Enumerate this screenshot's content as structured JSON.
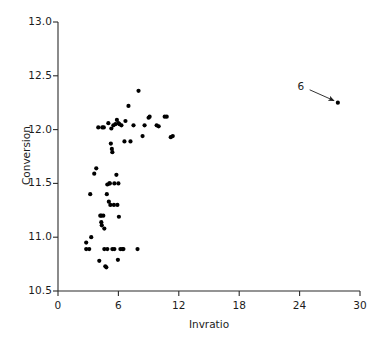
{
  "chart_data": {
    "type": "scatter",
    "title": "",
    "xlabel": "Invratio",
    "ylabel": "Conversion",
    "xlim": [
      0,
      30
    ],
    "ylim": [
      10.5,
      13.0
    ],
    "xticks": [
      0,
      6,
      12,
      18,
      24,
      30
    ],
    "yticks": [
      10.5,
      11.0,
      11.5,
      12.0,
      12.5,
      13.0
    ],
    "xticklabels": [
      "0",
      "6",
      "12",
      "18",
      "24",
      "30"
    ],
    "yticklabels": [
      "10.5",
      "11.0",
      "11.5",
      "12.0",
      "12.5",
      "13.0"
    ],
    "grid": false,
    "legend": false,
    "marker": "filled-circle",
    "marker_color": "#000000",
    "marker_size": 4.0,
    "points": [
      {
        "x": 2.8,
        "y": 10.95
      },
      {
        "x": 2.8,
        "y": 10.89
      },
      {
        "x": 3.1,
        "y": 10.89
      },
      {
        "x": 3.2,
        "y": 11.4
      },
      {
        "x": 3.3,
        "y": 11.0
      },
      {
        "x": 3.6,
        "y": 11.59
      },
      {
        "x": 3.8,
        "y": 11.64
      },
      {
        "x": 4.0,
        "y": 12.02
      },
      {
        "x": 4.1,
        "y": 10.78
      },
      {
        "x": 4.2,
        "y": 11.2
      },
      {
        "x": 4.3,
        "y": 11.2
      },
      {
        "x": 4.3,
        "y": 11.14
      },
      {
        "x": 4.35,
        "y": 11.11
      },
      {
        "x": 4.4,
        "y": 12.02
      },
      {
        "x": 4.5,
        "y": 11.2
      },
      {
        "x": 4.55,
        "y": 12.02
      },
      {
        "x": 4.6,
        "y": 11.08
      },
      {
        "x": 4.6,
        "y": 10.89
      },
      {
        "x": 4.7,
        "y": 10.73
      },
      {
        "x": 4.8,
        "y": 10.72
      },
      {
        "x": 4.85,
        "y": 11.4
      },
      {
        "x": 4.9,
        "y": 11.49
      },
      {
        "x": 4.9,
        "y": 10.89
      },
      {
        "x": 5.0,
        "y": 12.06
      },
      {
        "x": 5.05,
        "y": 11.33
      },
      {
        "x": 5.1,
        "y": 11.5
      },
      {
        "x": 5.15,
        "y": 11.5
      },
      {
        "x": 5.2,
        "y": 11.3
      },
      {
        "x": 5.25,
        "y": 11.87
      },
      {
        "x": 5.3,
        "y": 12.01
      },
      {
        "x": 5.35,
        "y": 11.82
      },
      {
        "x": 5.4,
        "y": 11.79
      },
      {
        "x": 5.4,
        "y": 10.89
      },
      {
        "x": 5.5,
        "y": 12.04
      },
      {
        "x": 5.55,
        "y": 11.3
      },
      {
        "x": 5.6,
        "y": 11.5
      },
      {
        "x": 5.6,
        "y": 10.89
      },
      {
        "x": 5.7,
        "y": 12.05
      },
      {
        "x": 5.8,
        "y": 11.58
      },
      {
        "x": 5.85,
        "y": 12.09
      },
      {
        "x": 5.9,
        "y": 11.3
      },
      {
        "x": 5.95,
        "y": 10.79
      },
      {
        "x": 6.0,
        "y": 12.06
      },
      {
        "x": 6.0,
        "y": 11.5
      },
      {
        "x": 6.05,
        "y": 11.19
      },
      {
        "x": 6.1,
        "y": 12.05
      },
      {
        "x": 6.2,
        "y": 10.89
      },
      {
        "x": 6.3,
        "y": 12.04
      },
      {
        "x": 6.4,
        "y": 10.89
      },
      {
        "x": 6.5,
        "y": 10.89
      },
      {
        "x": 6.6,
        "y": 11.89
      },
      {
        "x": 6.7,
        "y": 12.08
      },
      {
        "x": 7.0,
        "y": 12.22
      },
      {
        "x": 7.2,
        "y": 11.89
      },
      {
        "x": 7.5,
        "y": 12.04
      },
      {
        "x": 7.9,
        "y": 10.89
      },
      {
        "x": 8.0,
        "y": 12.36
      },
      {
        "x": 8.4,
        "y": 11.94
      },
      {
        "x": 8.6,
        "y": 12.04
      },
      {
        "x": 9.0,
        "y": 12.11
      },
      {
        "x": 9.1,
        "y": 12.12
      },
      {
        "x": 9.8,
        "y": 12.04
      },
      {
        "x": 10.0,
        "y": 12.03
      },
      {
        "x": 10.6,
        "y": 12.12
      },
      {
        "x": 10.8,
        "y": 12.12
      },
      {
        "x": 11.2,
        "y": 11.93
      },
      {
        "x": 11.4,
        "y": 11.94
      },
      {
        "x": 27.8,
        "y": 12.25
      }
    ],
    "annotations": [
      {
        "text": "6",
        "label_x": 24.2,
        "label_y": 12.4,
        "arrow_from_x": 25.0,
        "arrow_from_y": 12.37,
        "arrow_to_x": 27.4,
        "arrow_to_y": 12.27,
        "note": "callout pointing at outlier observation"
      }
    ]
  },
  "axes": {
    "spine_color": "#2b2b2b",
    "tick_color": "#2b2b2b",
    "background": "#ffffff"
  }
}
